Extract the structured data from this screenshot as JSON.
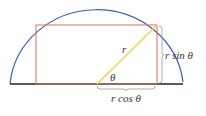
{
  "diagram": {
    "labels": {
      "radius": "r",
      "angle": "θ",
      "vertical": "r sin θ",
      "horizontal": "r cos θ"
    },
    "colors": {
      "arc": "#3a5fb0",
      "rectangle": "#e0705a",
      "radius_line": "#f0d050",
      "baseline": "#222222",
      "brace": "#999999"
    }
  }
}
